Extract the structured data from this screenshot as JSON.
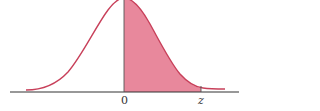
{
  "diagram": {
    "title": "",
    "type": "standard normal curve with shaded area from 0 to z",
    "labels": {
      "zero": "0",
      "z": "z"
    },
    "colors": {
      "curve": "#c8405a",
      "fill": "#e8889c",
      "axis": "#333333"
    }
  }
}
